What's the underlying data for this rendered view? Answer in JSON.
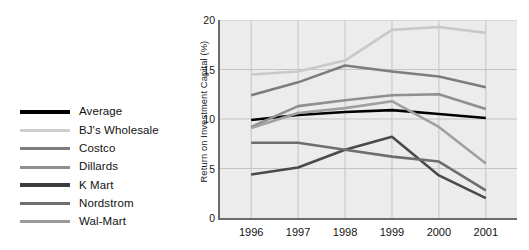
{
  "chart_data": {
    "type": "line",
    "title": "",
    "xlabel": "",
    "ylabel": "Return on Investment Capital (%)",
    "x": [
      "1996",
      "1997",
      "1998",
      "1999",
      "2000",
      "2001"
    ],
    "xlim": [
      1996,
      2001
    ],
    "ylim": [
      0,
      20
    ],
    "yticks": [
      "0",
      "5",
      "10",
      "15",
      "20"
    ],
    "grid": true,
    "legend_position": "left-outside",
    "series": [
      {
        "name": "Average",
        "color": "#000000",
        "width": 2.6,
        "values": [
          9.9,
          10.4,
          10.7,
          10.9,
          10.5,
          10.1
        ]
      },
      {
        "name": "BJ's Wholesale",
        "color": "#c9c9c9",
        "width": 2.6,
        "values": [
          14.5,
          14.8,
          15.9,
          19.0,
          19.3,
          18.7
        ]
      },
      {
        "name": "Costco",
        "color": "#7d7d7d",
        "width": 2.6,
        "values": [
          12.4,
          13.7,
          15.4,
          14.8,
          14.3,
          13.2
        ]
      },
      {
        "name": "Dillards",
        "color": "#8f8f8f",
        "width": 2.6,
        "values": [
          9.2,
          11.3,
          11.9,
          12.4,
          12.5,
          11.0
        ]
      },
      {
        "name": "K Mart",
        "color": "#4a4a4a",
        "width": 2.6,
        "values": [
          4.4,
          5.1,
          6.9,
          8.2,
          4.3,
          2.0
        ]
      },
      {
        "name": "Nordstrom",
        "color": "#6e6e6e",
        "width": 2.6,
        "values": [
          7.6,
          7.6,
          6.9,
          6.2,
          5.7,
          2.8
        ]
      },
      {
        "name": "Wal-Mart",
        "color": "#a0a0a0",
        "width": 2.6,
        "values": [
          9.1,
          10.6,
          11.1,
          11.8,
          9.2,
          5.5
        ]
      }
    ]
  },
  "legend": {
    "items": [
      {
        "label": "Average",
        "color": "#000000"
      },
      {
        "label": "BJ's Wholesale",
        "color": "#cfcfcf"
      },
      {
        "label": "Costco",
        "color": "#7d7d7d"
      },
      {
        "label": "Dillards",
        "color": "#8f8f8f"
      },
      {
        "label": "K Mart",
        "color": "#3d3d3d"
      },
      {
        "label": "Nordstrom",
        "color": "#6e6e6e"
      },
      {
        "label": "Wal-Mart",
        "color": "#9a9a9a"
      }
    ]
  },
  "axes": {
    "y_title": "Return on Investment Capital (%)",
    "y_ticks": [
      "20",
      "15",
      "10",
      "5",
      "0"
    ],
    "x_ticks": [
      "1996",
      "1997",
      "1998",
      "1999",
      "2000",
      "2001"
    ]
  },
  "colors": {
    "plot_background": "#ececec",
    "gridline": "#c4c4c4",
    "axis": "#6b6b6b",
    "text": "#111111"
  }
}
